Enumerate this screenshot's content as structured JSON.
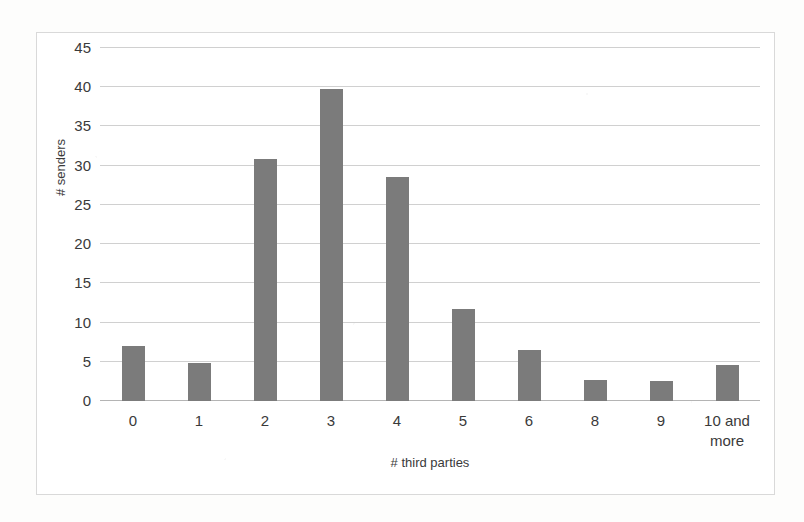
{
  "chart_data": {
    "type": "bar",
    "title": "",
    "xlabel": "# third parties",
    "ylabel": "# senders",
    "categories": [
      "0",
      "1",
      "2",
      "3",
      "4",
      "5",
      "6",
      "8",
      "9",
      "10 and\nmore"
    ],
    "values": [
      7,
      4.9,
      30.9,
      39.8,
      28.6,
      11.7,
      6.5,
      2.7,
      2.6,
      4.6
    ],
    "ylim": [
      0,
      45
    ],
    "ytick_labels": [
      "0",
      "5",
      "10",
      "15",
      "20",
      "25",
      "30",
      "35",
      "40",
      "45"
    ],
    "ytick_values": [
      0,
      5,
      10,
      15,
      20,
      25,
      30,
      35,
      40,
      45
    ],
    "grid": true,
    "legend": "none",
    "bar_color": "#7b7b7b",
    "gridline_color": "#d0d0d0",
    "axis_color": "#b4b4b4",
    "frame_color": "#d9d9d9",
    "text_color": "#3a3a3a"
  }
}
